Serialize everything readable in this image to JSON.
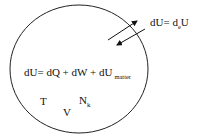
{
  "diagram": {
    "type": "open thermodynamic system",
    "system_boundary": {
      "shape": "ellipse",
      "stroke": "#222222"
    },
    "exchange": {
      "label_main": "dU= d",
      "label_sub": "e",
      "label_tail": "U",
      "arrows": [
        "outward",
        "inward"
      ]
    },
    "equation": {
      "main": "dU= dQ + dW + dU",
      "sub": "matter"
    },
    "state_variables": {
      "temperature": "T",
      "volume": "V",
      "moles_main": "N",
      "moles_sub": "k"
    }
  }
}
